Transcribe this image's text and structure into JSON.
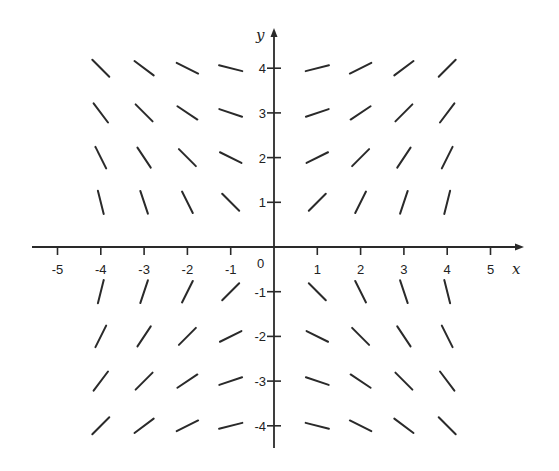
{
  "chart_data": {
    "type": "slope_field",
    "title": "",
    "xlabel": "x",
    "ylabel": "y",
    "differential_equation": "dy/dx = x/y",
    "xlim": [
      -5.5,
      5.5
    ],
    "ylim": [
      -4.5,
      4.5
    ],
    "x_ticks": [
      -5,
      -4,
      -3,
      -2,
      -1,
      1,
      2,
      3,
      4,
      5
    ],
    "x_tick_labels": [
      "-5",
      "-4",
      "-3",
      "-2",
      "-1",
      "1",
      "2",
      "3",
      "4",
      "5"
    ],
    "y_ticks": [
      4,
      3,
      2,
      1,
      -1,
      -2,
      -3,
      -4
    ],
    "y_tick_labels": [
      "4",
      "3",
      "2",
      "1",
      "-1",
      "-2",
      "-3",
      "-4"
    ],
    "origin_label": "0",
    "grid": false,
    "legend": null,
    "sample_x": [
      -4,
      -3,
      -2,
      -1,
      1,
      2,
      3,
      4
    ],
    "sample_y": [
      4,
      3,
      2,
      1,
      -1,
      -2,
      -3,
      -4
    ],
    "segments": [
      {
        "x": -4,
        "y": 4,
        "slope": -1
      },
      {
        "x": -3,
        "y": 4,
        "slope": -0.75
      },
      {
        "x": -2,
        "y": 4,
        "slope": -0.5
      },
      {
        "x": -1,
        "y": 4,
        "slope": -0.25
      },
      {
        "x": 1,
        "y": 4,
        "slope": 0.25
      },
      {
        "x": 2,
        "y": 4,
        "slope": 0.5
      },
      {
        "x": 3,
        "y": 4,
        "slope": 0.75
      },
      {
        "x": 4,
        "y": 4,
        "slope": 1
      },
      {
        "x": -4,
        "y": 3,
        "slope": -1.333
      },
      {
        "x": -3,
        "y": 3,
        "slope": -1
      },
      {
        "x": -2,
        "y": 3,
        "slope": -0.667
      },
      {
        "x": -1,
        "y": 3,
        "slope": -0.333
      },
      {
        "x": 1,
        "y": 3,
        "slope": 0.333
      },
      {
        "x": 2,
        "y": 3,
        "slope": 0.667
      },
      {
        "x": 3,
        "y": 3,
        "slope": 1
      },
      {
        "x": 4,
        "y": 3,
        "slope": 1.333
      },
      {
        "x": -4,
        "y": 2,
        "slope": -2
      },
      {
        "x": -3,
        "y": 2,
        "slope": -1.5
      },
      {
        "x": -2,
        "y": 2,
        "slope": -1
      },
      {
        "x": -1,
        "y": 2,
        "slope": -0.5
      },
      {
        "x": 1,
        "y": 2,
        "slope": 0.5
      },
      {
        "x": 2,
        "y": 2,
        "slope": 1
      },
      {
        "x": 3,
        "y": 2,
        "slope": 1.5
      },
      {
        "x": 4,
        "y": 2,
        "slope": 2
      },
      {
        "x": -4,
        "y": 1,
        "slope": -4
      },
      {
        "x": -3,
        "y": 1,
        "slope": -3
      },
      {
        "x": -2,
        "y": 1,
        "slope": -2
      },
      {
        "x": -1,
        "y": 1,
        "slope": -1
      },
      {
        "x": 1,
        "y": 1,
        "slope": 1
      },
      {
        "x": 2,
        "y": 1,
        "slope": 2
      },
      {
        "x": 3,
        "y": 1,
        "slope": 3
      },
      {
        "x": 4,
        "y": 1,
        "slope": 4
      },
      {
        "x": -4,
        "y": -1,
        "slope": 4
      },
      {
        "x": -3,
        "y": -1,
        "slope": 3
      },
      {
        "x": -2,
        "y": -1,
        "slope": 2
      },
      {
        "x": -1,
        "y": -1,
        "slope": 1
      },
      {
        "x": 1,
        "y": -1,
        "slope": -1
      },
      {
        "x": 2,
        "y": -1,
        "slope": -2
      },
      {
        "x": 3,
        "y": -1,
        "slope": -3
      },
      {
        "x": 4,
        "y": -1,
        "slope": -4
      },
      {
        "x": -4,
        "y": -2,
        "slope": 2
      },
      {
        "x": -3,
        "y": -2,
        "slope": 1.5
      },
      {
        "x": -2,
        "y": -2,
        "slope": 1
      },
      {
        "x": -1,
        "y": -2,
        "slope": 0.5
      },
      {
        "x": 1,
        "y": -2,
        "slope": -0.5
      },
      {
        "x": 2,
        "y": -2,
        "slope": -1
      },
      {
        "x": 3,
        "y": -2,
        "slope": -1.5
      },
      {
        "x": 4,
        "y": -2,
        "slope": -2
      },
      {
        "x": -4,
        "y": -3,
        "slope": 1.333
      },
      {
        "x": -3,
        "y": -3,
        "slope": 1
      },
      {
        "x": -2,
        "y": -3,
        "slope": 0.667
      },
      {
        "x": -1,
        "y": -3,
        "slope": 0.333
      },
      {
        "x": 1,
        "y": -3,
        "slope": -0.333
      },
      {
        "x": 2,
        "y": -3,
        "slope": -0.667
      },
      {
        "x": 3,
        "y": -3,
        "slope": -1
      },
      {
        "x": 4,
        "y": -3,
        "slope": -1.333
      },
      {
        "x": -4,
        "y": -4,
        "slope": 1
      },
      {
        "x": -3,
        "y": -4,
        "slope": 0.75
      },
      {
        "x": -2,
        "y": -4,
        "slope": 0.5
      },
      {
        "x": -1,
        "y": -4,
        "slope": 0.25
      },
      {
        "x": 1,
        "y": -4,
        "slope": -0.25
      },
      {
        "x": 2,
        "y": -4,
        "slope": -0.5
      },
      {
        "x": 3,
        "y": -4,
        "slope": -0.75
      },
      {
        "x": 4,
        "y": -4,
        "slope": -1
      }
    ]
  },
  "style": {
    "stroke_color": "#2a2a2a",
    "background": "#ffffff"
  },
  "layout": {
    "origin_px": [
      274,
      247
    ],
    "unit_x_px": 43.3,
    "unit_y_px": 44.7,
    "segment_length_px": 24,
    "x_axis_from_px": 32,
    "x_axis_to_px": 524,
    "y_axis_from_px": 448,
    "y_axis_to_px": 28
  }
}
